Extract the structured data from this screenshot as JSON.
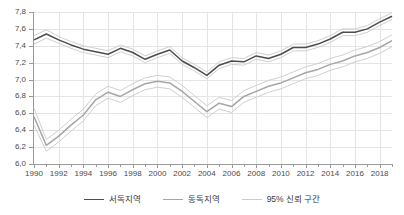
{
  "chart_data": {
    "type": "line",
    "title": "",
    "xlabel": "",
    "ylabel": "",
    "xlim": [
      1990,
      2019
    ],
    "ylim": [
      6.0,
      7.8
    ],
    "grid": true,
    "legend_position": "bottom",
    "decimal_separator": ",",
    "y_ticks": [
      "6,0",
      "6,2",
      "6,4",
      "6,6",
      "6,8",
      "7,0",
      "7,2",
      "7,4",
      "7,6",
      "7,8"
    ],
    "y_tick_values": [
      6.0,
      6.2,
      6.4,
      6.6,
      6.8,
      7.0,
      7.2,
      7.4,
      7.6,
      7.8
    ],
    "x_ticks": [
      "1990",
      "1992",
      "1994",
      "1996",
      "1998",
      "2000",
      "2002",
      "2004",
      "2006",
      "2008",
      "2010",
      "2012",
      "2014",
      "2016",
      "2018"
    ],
    "x_tick_values": [
      1990,
      1992,
      1994,
      1996,
      1998,
      2000,
      2002,
      2004,
      2006,
      2008,
      2010,
      2012,
      2014,
      2016,
      2018
    ],
    "x": [
      1990,
      1991,
      1992,
      1993,
      1994,
      1995,
      1996,
      1997,
      1998,
      1999,
      2000,
      2001,
      2002,
      2003,
      2004,
      2005,
      2006,
      2007,
      2008,
      2009,
      2010,
      2011,
      2012,
      2013,
      2014,
      2015,
      2016,
      2017,
      2018,
      2019
    ],
    "series": [
      {
        "name": "서독지역",
        "color": "#4d4d4d",
        "values": [
          7.47,
          7.54,
          7.47,
          7.41,
          7.36,
          7.33,
          7.3,
          7.37,
          7.32,
          7.24,
          7.3,
          7.35,
          7.22,
          7.14,
          7.05,
          7.17,
          7.22,
          7.21,
          7.28,
          7.25,
          7.3,
          7.38,
          7.38,
          7.42,
          7.48,
          7.56,
          7.56,
          7.6,
          7.68,
          7.75
        ],
        "ci_upper": [
          7.52,
          7.59,
          7.51,
          7.45,
          7.4,
          7.37,
          7.34,
          7.41,
          7.36,
          7.28,
          7.34,
          7.39,
          7.26,
          7.18,
          7.09,
          7.21,
          7.26,
          7.25,
          7.32,
          7.29,
          7.34,
          7.42,
          7.42,
          7.46,
          7.52,
          7.6,
          7.6,
          7.64,
          7.72,
          7.79
        ],
        "ci_lower": [
          7.42,
          7.49,
          7.43,
          7.37,
          7.32,
          7.29,
          7.26,
          7.33,
          7.28,
          7.2,
          7.26,
          7.31,
          7.18,
          7.1,
          7.01,
          7.13,
          7.18,
          7.17,
          7.24,
          7.21,
          7.26,
          7.34,
          7.34,
          7.38,
          7.44,
          7.52,
          7.52,
          7.56,
          7.64,
          7.71
        ]
      },
      {
        "name": "동독지역",
        "color": "#a6a6a6",
        "values": [
          6.56,
          6.22,
          6.33,
          6.46,
          6.58,
          6.76,
          6.85,
          6.8,
          6.88,
          6.95,
          6.98,
          6.96,
          6.86,
          6.74,
          6.62,
          6.72,
          6.68,
          6.8,
          6.86,
          6.92,
          6.96,
          7.02,
          7.08,
          7.12,
          7.18,
          7.22,
          7.28,
          7.32,
          7.38,
          7.46
        ],
        "ci_upper": [
          6.66,
          6.29,
          6.4,
          6.53,
          6.65,
          6.83,
          6.92,
          6.87,
          6.95,
          7.02,
          7.05,
          7.03,
          6.93,
          6.81,
          6.69,
          6.79,
          6.75,
          6.87,
          6.93,
          6.99,
          7.03,
          7.09,
          7.15,
          7.19,
          7.25,
          7.29,
          7.35,
          7.39,
          7.45,
          7.53
        ],
        "ci_lower": [
          6.46,
          6.15,
          6.26,
          6.39,
          6.51,
          6.69,
          6.78,
          6.73,
          6.81,
          6.88,
          6.91,
          6.89,
          6.79,
          6.67,
          6.55,
          6.65,
          6.61,
          6.73,
          6.79,
          6.85,
          6.89,
          6.95,
          7.01,
          7.05,
          7.11,
          7.15,
          7.21,
          7.25,
          7.31,
          7.39
        ]
      }
    ],
    "legend": [
      {
        "label": "서독지역",
        "color": "#4d4d4d"
      },
      {
        "label": "동독지역",
        "color": "#a6a6a6"
      },
      {
        "label": "95% 신뢰 구간",
        "color": "#cccccc"
      }
    ]
  }
}
